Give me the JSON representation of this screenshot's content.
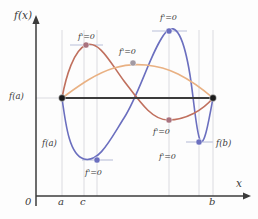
{
  "figure": {
    "axes": {
      "y_label": "f(x)",
      "x_label": "x",
      "origin_label": "0",
      "x_ticks": [
        {
          "label": "a",
          "x": 62
        },
        {
          "label": "c",
          "x": 84
        },
        {
          "label": "b",
          "x": 213
        }
      ],
      "y_ticks": [
        {
          "label": "f(a)",
          "y": 98
        }
      ]
    },
    "endpoint_labels": [
      {
        "name": "left-endpoint-value",
        "text": "f(a)",
        "x": 42,
        "y": 139
      },
      {
        "name": "right-endpoint-value",
        "text": "f(b)",
        "x": 216,
        "y": 139
      }
    ],
    "critical_labels": [
      {
        "name": "crit-label-red-max",
        "text": "f'=0",
        "x": 78,
        "y": 33
      },
      {
        "name": "crit-label-orange-max",
        "text": "f'=0",
        "x": 119,
        "y": 48
      },
      {
        "name": "crit-label-blue-max",
        "text": "f'=0",
        "x": 160,
        "y": 14
      },
      {
        "name": "crit-label-red-min",
        "text": "f'=0",
        "x": 153,
        "y": 128
      },
      {
        "name": "crit-label-blue-min-right",
        "text": "f'=0",
        "x": 159,
        "y": 153
      },
      {
        "name": "crit-label-blue-min-left",
        "text": "f'=0",
        "x": 85,
        "y": 169
      }
    ]
  },
  "chart_data": {
    "type": "line",
    "xlabel": "x",
    "ylabel": "f(x)",
    "xlim": [
      0,
      258
    ],
    "ylim": [
      0,
      219
    ],
    "grid": false,
    "legend": "none",
    "secant_line": {
      "name": "secant-f(a)-to-f(b)",
      "from": [
        62,
        98
      ],
      "to": [
        213,
        98
      ],
      "color": "#3b3b3b",
      "value": "f(a) = f(b)"
    },
    "series": [
      {
        "name": "blue-curve",
        "color": "#6b6fbf",
        "path": "M 62 98 C 66 128, 70 155, 84 159 C 99 163, 110 140, 124 118 C 140 93, 152 48, 166 32 C 176 21, 184 38, 190 75 C 194 100, 196 131, 200 140 C 204 149, 209 120, 213 98",
        "critical_points": [
          {
            "label": "f'=0",
            "x": 97,
            "y": 160
          },
          {
            "label": "f'=0",
            "x": 169,
            "y": 31
          },
          {
            "label": "f'=0",
            "x": 199,
            "y": 142
          }
        ]
      },
      {
        "name": "red-curve",
        "color": "#c0705e",
        "path": "M 62 98 C 66 76, 74 50, 86 45 C 99 40, 110 62, 124 81 C 140 102, 152 120, 168 120 C 186 120, 203 110, 213 98",
        "critical_points": [
          {
            "label": "f'=0",
            "x": 86,
            "y": 45
          },
          {
            "label": "f'=0",
            "x": 169,
            "y": 120
          }
        ]
      },
      {
        "name": "orange-curve",
        "color": "#e9b183",
        "path": "M 62 98 C 76 88, 94 74, 114 68 C 134 62, 158 64, 178 74 C 194 82, 206 92, 213 98",
        "critical_points": [
          {
            "label": "f'=0",
            "x": 133,
            "y": 63
          }
        ]
      }
    ],
    "tangent_segments": [
      {
        "name": "tangent-red-max",
        "x1": 70,
        "y1": 45,
        "x2": 103,
        "y2": 45
      },
      {
        "name": "tangent-blue-max",
        "x1": 152,
        "y1": 31,
        "x2": 187,
        "y2": 31
      },
      {
        "name": "tangent-blue-min-left",
        "x1": 82,
        "y1": 160,
        "x2": 113,
        "y2": 160
      },
      {
        "name": "tangent-blue-min-right",
        "x1": 186,
        "y1": 142,
        "x2": 213,
        "y2": 142
      }
    ],
    "vertical_guides": [
      {
        "name": "guide-a",
        "x": 62
      },
      {
        "name": "guide-c",
        "x": 84
      },
      {
        "name": "guide-crit-blue-min",
        "x": 97
      },
      {
        "name": "guide-crit-blue-max",
        "x": 169
      },
      {
        "name": "guide-crit-blue-min-right",
        "x": 199
      },
      {
        "name": "guide-b",
        "x": 213
      }
    ],
    "markers": [
      {
        "name": "endpoint-a",
        "x": 62,
        "y": 98,
        "color": "#1b1b1b",
        "r": 3.4
      },
      {
        "name": "endpoint-b",
        "x": 213,
        "y": 98,
        "color": "#1b1b1b",
        "r": 3.4
      },
      {
        "name": "crit-red-max",
        "x": 86,
        "y": 45,
        "color": "#a9737f",
        "r": 3.1
      },
      {
        "name": "crit-orange-max",
        "x": 133,
        "y": 63,
        "color": "#a29aa3",
        "r": 3.1
      },
      {
        "name": "crit-blue-max",
        "x": 169,
        "y": 31,
        "color": "#6b6fbf",
        "r": 3.1
      },
      {
        "name": "crit-red-min",
        "x": 169,
        "y": 120,
        "color": "#a9737f",
        "r": 3.1
      },
      {
        "name": "crit-blue-min-left",
        "x": 97,
        "y": 160,
        "color": "#6b6fbf",
        "r": 3.1
      },
      {
        "name": "crit-blue-min-right",
        "x": 199,
        "y": 142,
        "color": "#6b6fbf",
        "r": 3.1
      }
    ]
  },
  "colors": {
    "blue": "#6b6fbf",
    "red": "#c0705e",
    "orange": "#e9b183",
    "axis": "#3b3b3b",
    "guide": "#d2d2d8",
    "tangent": "#cfd3e4",
    "background": "#fdfdfd"
  }
}
